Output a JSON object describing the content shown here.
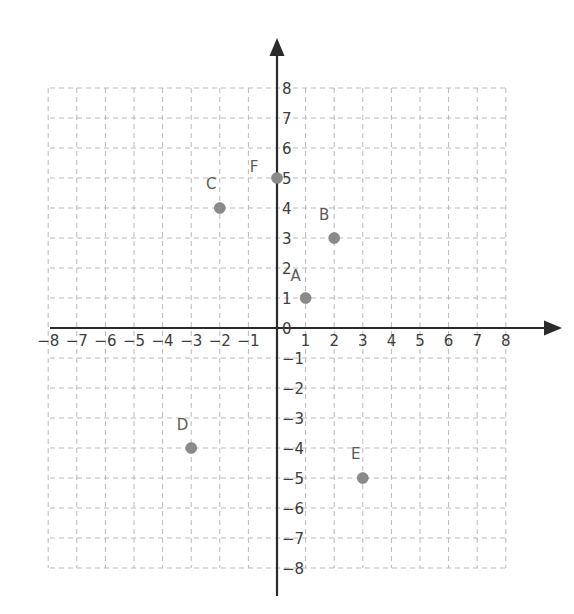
{
  "chart_data": {
    "type": "scatter",
    "title": "",
    "xlabel": "",
    "ylabel": "",
    "xlim": [
      -8,
      8
    ],
    "ylim": [
      -8,
      8
    ],
    "grid": true,
    "grid_step": 1,
    "legend": "none",
    "x_tick_labels": [
      "−8",
      "−7",
      "−6",
      "−5",
      "−4",
      "−3",
      "−2",
      "−1",
      "1",
      "2",
      "3",
      "4",
      "5",
      "6",
      "7",
      "8"
    ],
    "x_tick_values": [
      -8,
      -7,
      -6,
      -5,
      -4,
      -3,
      -2,
      -1,
      1,
      2,
      3,
      4,
      5,
      6,
      7,
      8
    ],
    "y_tick_labels": [
      "8",
      "7",
      "6",
      "5",
      "4",
      "3",
      "2",
      "1",
      "0",
      "−1",
      "−2",
      "−3",
      "−4",
      "−5",
      "−6",
      "−7",
      "−8"
    ],
    "y_tick_values": [
      8,
      7,
      6,
      5,
      4,
      3,
      2,
      1,
      0,
      -1,
      -2,
      -3,
      -4,
      -5,
      -6,
      -7,
      -8
    ],
    "points": [
      {
        "label": "A",
        "x": 1,
        "y": 1,
        "label_dx": -0.35,
        "label_dy": 0.75
      },
      {
        "label": "B",
        "x": 2,
        "y": 3,
        "label_dx": -0.35,
        "label_dy": 0.78
      },
      {
        "label": "C",
        "x": -2,
        "y": 4,
        "label_dx": -0.3,
        "label_dy": 0.8
      },
      {
        "label": "D",
        "x": -3,
        "y": -4,
        "label_dx": -0.3,
        "label_dy": 0.78
      },
      {
        "label": "E",
        "x": 3,
        "y": -5,
        "label_dx": -0.25,
        "label_dy": 0.8
      },
      {
        "label": "F",
        "x": 0,
        "y": 5,
        "label_dx": -0.8,
        "label_dy": 0.38
      }
    ],
    "colors": {
      "point_fill": "#8a8a8a",
      "grid": "#b9b9b9",
      "axis": "#2b2b2b",
      "tick_text": "#3d3d3d",
      "label_text": "#5c5c5c",
      "background": "#ffffff"
    }
  },
  "geometry": {
    "origin_x": 277,
    "origin_y": 328,
    "unit_x": 28.6,
    "unit_y": 30,
    "grid_left": 50,
    "grid_right": 508,
    "grid_top": 88,
    "grid_bottom": 568,
    "x_axis_start": 50,
    "x_axis_end": 548,
    "x_arrow_tip": 562,
    "y_axis_top": 52,
    "y_arrow_tip": 38,
    "y_axis_bottom": 596,
    "dot_radius": 5.5
  }
}
